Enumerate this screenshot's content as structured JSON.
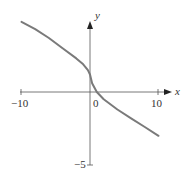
{
  "chart_data": {
    "type": "line",
    "title": "",
    "xlabel": "x",
    "ylabel": "y",
    "xlim": [
      -10,
      10
    ],
    "ylim": [
      -5,
      5
    ],
    "x_ticks": [
      {
        "value": -10,
        "label": "−10"
      },
      {
        "value": 10,
        "label": "10"
      }
    ],
    "y_ticks": [
      {
        "value": -5,
        "label": "−5"
      }
    ],
    "origin_label": "0",
    "grid": false,
    "legend": null,
    "series": [
      {
        "name": "curve",
        "color": "#7a7a7a",
        "points": [
          [
            -10,
            4.8
          ],
          [
            -8,
            4.3
          ],
          [
            -6,
            3.7
          ],
          [
            -4,
            3.0
          ],
          [
            -2,
            2.3
          ],
          [
            -1,
            1.9
          ],
          [
            -0.3,
            1.5
          ],
          [
            0,
            1.2
          ],
          [
            0.3,
            0.6
          ],
          [
            1,
            0.0
          ],
          [
            2,
            -0.5
          ],
          [
            4,
            -1.2
          ],
          [
            6,
            -1.8
          ],
          [
            8,
            -2.4
          ],
          [
            10,
            -3.0
          ]
        ]
      }
    ]
  },
  "axes": {
    "x_label": "x",
    "y_label": "y",
    "x_min_label": "−10",
    "x_max_label": "10",
    "origin_label": "0",
    "y_min_label": "−5"
  }
}
